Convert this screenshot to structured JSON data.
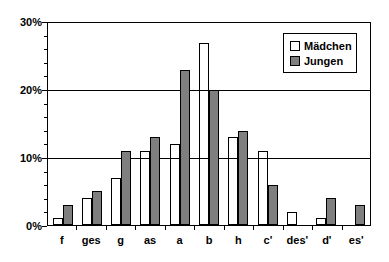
{
  "figure": {
    "background": "#ffffff",
    "axis_color": "#000000",
    "text_color": "#000000"
  },
  "chart_data": {
    "type": "bar",
    "title": "",
    "xlabel": "",
    "ylabel": "",
    "categories": [
      "f",
      "ges",
      "g",
      "as",
      "a",
      "b",
      "h",
      "c'",
      "des'",
      "d'",
      "es'"
    ],
    "series": [
      {
        "name": "Mädchen",
        "fill": "transparent",
        "swatch": "#ffffff",
        "values": [
          1,
          4,
          7,
          11,
          12,
          27,
          13,
          11,
          2,
          1,
          0
        ]
      },
      {
        "name": "Jungen",
        "fill": "#7f7f7f",
        "swatch": "#7f7f7f",
        "values": [
          3,
          5,
          11,
          13,
          23,
          20,
          14,
          6,
          0,
          4,
          3
        ]
      }
    ],
    "ylim": [
      0,
      30
    ],
    "yticks": [
      {
        "value": 0,
        "label": "0%"
      },
      {
        "value": 10,
        "label": "10%"
      },
      {
        "value": 20,
        "label": "20%"
      },
      {
        "value": 30,
        "label": "30%"
      }
    ],
    "minor_tick_step": 2,
    "grid": true,
    "legend_position": "top-right",
    "bar_border_color": "#000000"
  }
}
